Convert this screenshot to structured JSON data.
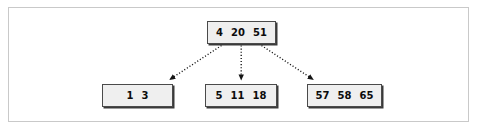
{
  "figure": {
    "kind": "b-tree-diagram",
    "background_color": "#ffffff",
    "frame_color": "#c9c9c9",
    "node_fill_color": "#efefef",
    "node_border_color": "#4a4a4a",
    "edge_color": "#1a1a1a",
    "edge_style": "dotted",
    "arrowhead": "solid-triangle"
  },
  "tree": {
    "root": {
      "id": "root",
      "keys": [
        "4",
        "20",
        "51"
      ]
    },
    "leaves": [
      {
        "id": "leaf-1",
        "keys": [
          "1",
          "3"
        ]
      },
      {
        "id": "leaf-2",
        "keys": [
          "5",
          "11",
          "18"
        ]
      },
      {
        "id": "leaf-3",
        "keys": [
          "57",
          "58",
          "65"
        ]
      }
    ]
  },
  "edges": [
    {
      "id": "edge-root-to-leaf-1",
      "from": "root",
      "to": "leaf-1"
    },
    {
      "id": "edge-root-to-leaf-2",
      "from": "root",
      "to": "leaf-2"
    },
    {
      "id": "edge-root-to-leaf-3",
      "from": "root",
      "to": "leaf-3"
    }
  ]
}
